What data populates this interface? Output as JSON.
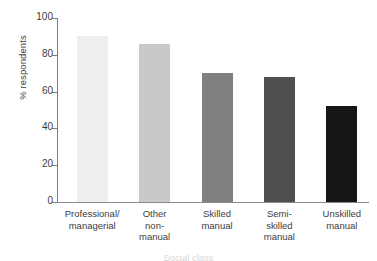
{
  "chart_data": {
    "type": "bar",
    "title": "",
    "xlabel": "Social class",
    "ylabel": "% respondents",
    "categories": [
      "Professional/\nmanagerial",
      "Other\nnon-\nmanual",
      "Skilled\nmanual",
      "Semi-\nskilled\nmanual",
      "Unskilled\nmanual"
    ],
    "values": [
      90,
      86,
      70,
      68,
      52
    ],
    "ylim": [
      0,
      100
    ],
    "yticks": [
      0,
      20,
      40,
      60,
      80,
      100
    ],
    "ytick_labels": [
      "0",
      "20",
      "40",
      "60",
      "80",
      "100"
    ],
    "grid": false,
    "legend": "none",
    "bar_colors": [
      "#eeeeee",
      "#c9c9c9",
      "#808080",
      "#4f4f4f",
      "#161616"
    ]
  }
}
